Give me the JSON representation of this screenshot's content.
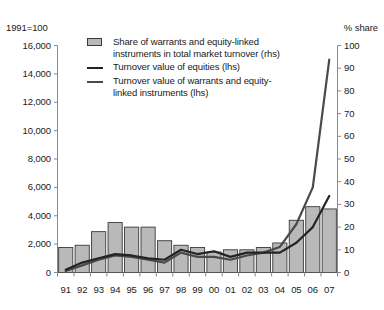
{
  "axis_captions": {
    "left": "1991=100",
    "right": "% share"
  },
  "legend": {
    "items": [
      {
        "key": "bar-swatch",
        "line1": "Share of warrants and equity-linked",
        "line2": "instruments in total market turnover (rhs)"
      },
      {
        "key": "line-dark",
        "line1": "Turnover value of equities (lhs)",
        "line2": ""
      },
      {
        "key": "line-medium",
        "line1": "Turnover value of warrants and equity-",
        "line2": "linked instruments (lhs)"
      }
    ]
  },
  "colors": {
    "bar_fill": "#b9b9b9",
    "bar_stroke": "#3a3a3a",
    "line_equities": "#232323",
    "line_warrants": "#4a4a4a",
    "axis": "#8a8a8a",
    "text": "#1a1a1a"
  },
  "chart_data": {
    "type": "bar",
    "title": "",
    "subtitle": "",
    "xlabel": "",
    "ylabel": "1991=100",
    "y2label": "% share",
    "ylim": [
      0,
      16000
    ],
    "y2lim": [
      0,
      100
    ],
    "grid": false,
    "legend_position": "top",
    "categories": [
      "91",
      "92",
      "93",
      "94",
      "95",
      "96",
      "97",
      "98",
      "99",
      "00",
      "01",
      "02",
      "03",
      "04",
      "05",
      "06",
      "07"
    ],
    "yticks": [
      "0",
      "2,000",
      "4,000",
      "6,000",
      "8,000",
      "10,000",
      "12,000",
      "14,000",
      "16,000"
    ],
    "ytick_values": [
      0,
      2000,
      4000,
      6000,
      8000,
      10000,
      12000,
      14000,
      16000
    ],
    "y2ticks": [
      "0",
      "10",
      "20",
      "30",
      "40",
      "50",
      "60",
      "70",
      "80",
      "90",
      "100"
    ],
    "y2tick_values": [
      0,
      10,
      20,
      30,
      40,
      50,
      60,
      70,
      80,
      90,
      100
    ],
    "series": [
      {
        "name": "Share of warrants and equity-linked instruments in total market turnover (rhs)",
        "type": "bar",
        "axis": "right",
        "unit": "% share",
        "values": [
          11,
          12,
          18,
          22,
          20,
          20,
          14,
          12,
          11,
          9,
          10,
          10,
          11,
          13,
          23,
          29,
          28
        ]
      },
      {
        "name": "Turnover value of equities (lhs)",
        "type": "line",
        "axis": "left",
        "unit": "1991=100",
        "values": [
          200,
          700,
          1000,
          1300,
          1200,
          1000,
          900,
          1600,
          1300,
          1500,
          1100,
          1400,
          1400,
          1400,
          2100,
          3200,
          5400
        ]
      },
      {
        "name": "Turnover value of warrants and equity-linked instruments (lhs)",
        "type": "line",
        "axis": "left",
        "unit": "1991=100",
        "values": [
          100,
          500,
          900,
          1200,
          1100,
          900,
          700,
          1400,
          1100,
          1100,
          900,
          1200,
          1400,
          1800,
          3400,
          6000,
          15000
        ]
      }
    ]
  }
}
